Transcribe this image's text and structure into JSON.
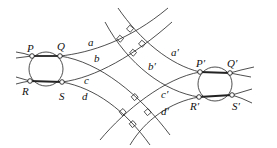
{
  "figure": {
    "type": "geometric-diagram",
    "left_points": {
      "P": "P",
      "Q": "Q",
      "R": "R",
      "S": "S"
    },
    "right_points": {
      "P": "P′",
      "Q": "Q′",
      "R": "R′",
      "S": "S′"
    },
    "left_curves": {
      "a": "a",
      "b": "b",
      "c": "c",
      "d": "d"
    },
    "right_curves": {
      "a": "a′",
      "b": "b′",
      "c": "c′",
      "d": "d′"
    },
    "right_angle_markers": 8,
    "stroke_color": "#222222",
    "background": "#ffffff"
  }
}
